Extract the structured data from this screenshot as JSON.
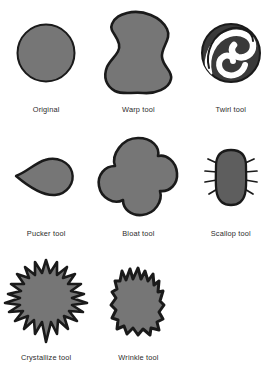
{
  "figure": {
    "background_color": "#ffffff",
    "fill_color": "#767676",
    "stroke_color": "#1a1a1a",
    "caption_color": "#2b2b2b"
  },
  "rows": [
    {
      "items": [
        {
          "label": "Original",
          "shape": "circle-shape",
          "icon": "original-circle-icon"
        },
        {
          "label": "Warp tool",
          "shape": "warp-blob-shape",
          "icon": "warp-blob-icon"
        },
        {
          "label": "Twirl tool",
          "shape": "twirl-spiral-shape",
          "icon": "twirl-spiral-icon"
        }
      ]
    },
    {
      "items": [
        {
          "label": "Pucker tool",
          "shape": "pucker-teardrop-shape",
          "icon": "pucker-teardrop-icon"
        },
        {
          "label": "Bloat tool",
          "shape": "bloat-clover-shape",
          "icon": "bloat-clover-icon"
        },
        {
          "label": "Scallop tool",
          "shape": "scallop-spiked-shape",
          "icon": "scallop-spiked-icon"
        }
      ]
    },
    {
      "items": [
        {
          "label": "Crystallize tool",
          "shape": "crystallize-starburst-shape",
          "icon": "crystallize-starburst-icon"
        },
        {
          "label": "Wrinkle tool",
          "shape": "wrinkle-jagged-shape",
          "icon": "wrinkle-jagged-icon"
        },
        {
          "label": "",
          "shape": "empty-shape",
          "icon": "empty-icon"
        }
      ]
    }
  ]
}
